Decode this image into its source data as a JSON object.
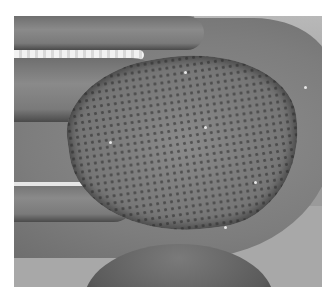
{
  "image": {
    "description": "Grayscale clinical photograph of the dorsum of a hand with a large mesh-patterned skin lesion",
    "colors": {
      "border": "#ffffff",
      "skin": "#8a8a8a",
      "background": "#a8a8a8",
      "lesion_dark": "#4a4a4a"
    }
  }
}
